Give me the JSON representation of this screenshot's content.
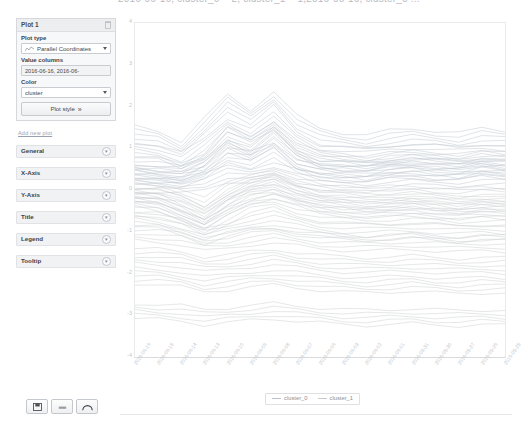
{
  "top_strip": {
    "clipped_text": "2016-06-16, cluster_0 = 2, cluster_1 = 1,2016-06-16, cluster_0 ..."
  },
  "panel": {
    "plot_card": {
      "title": "Plot 1",
      "delete_icon": "trash-icon",
      "plot_type": {
        "label": "Plot type",
        "value": "Parallel Coordinates",
        "icon": "line-chart-icon",
        "caret": "chevron-down-icon"
      },
      "value_columns": {
        "label": "Value columns",
        "value": "2016-06-16, 2016-06-"
      },
      "color": {
        "label": "Color",
        "value": "cluster",
        "caret": "chevron-down-icon"
      },
      "style_button": {
        "label": "Plot style",
        "icon": "double-chevron-right-icon"
      }
    },
    "add_link": "Add new plot",
    "accordion": [
      {
        "label": "General",
        "toggle": "collapse-toggle"
      },
      {
        "label": "X-Axis",
        "toggle": "collapse-toggle"
      },
      {
        "label": "Y-Axis",
        "toggle": "collapse-toggle"
      },
      {
        "label": "Title",
        "toggle": "collapse-toggle"
      },
      {
        "label": "Legend",
        "toggle": "collapse-toggle"
      },
      {
        "label": "Tooltip",
        "toggle": "collapse-toggle"
      }
    ],
    "toolbar": [
      {
        "name": "save-button",
        "icon": "floppy-disk-icon"
      },
      {
        "name": "export-button",
        "icon": "file-icon"
      },
      {
        "name": "theme-button",
        "icon": "arc-icon"
      }
    ]
  },
  "chart_data": {
    "type": "line",
    "title": "",
    "xlabel": "",
    "ylabel": "",
    "ylim": [
      -4,
      4
    ],
    "yticks": [
      4,
      3,
      2,
      1,
      0,
      -1,
      -2,
      -3,
      -4
    ],
    "grid": false,
    "legend_position": "bottom",
    "legend": [
      "cluster_0",
      "cluster_1"
    ],
    "colors": {
      "cluster_0": "#b9c2cc",
      "cluster_1": "#c8c9cc"
    },
    "categories": [
      "2016-06-16",
      "2016-06-15",
      "2016-06-14",
      "2016-06-13",
      "2016-06-10",
      "2016-06-09",
      "2016-06-08",
      "2016-06-07",
      "2016-06-06",
      "2016-06-03",
      "2016-06-02",
      "2016-06-01",
      "2016-05-31",
      "2016-05-30",
      "2016-05-27",
      "2016-05-26",
      "2016-05-25"
    ],
    "series": [
      {
        "name": "cluster_0",
        "values": [
          0.45,
          0.4,
          0.35,
          0.55,
          1.05,
          0.85,
          1.25,
          0.7,
          0.55,
          0.5,
          0.45,
          0.55,
          0.6,
          0.55,
          0.5,
          0.6,
          0.55
        ]
      },
      {
        "name": "cluster_0",
        "values": [
          0.3,
          0.28,
          0.25,
          0.4,
          0.8,
          0.7,
          0.95,
          0.55,
          0.4,
          0.38,
          0.35,
          0.42,
          0.45,
          0.42,
          0.4,
          0.48,
          0.45
        ]
      },
      {
        "name": "cluster_0",
        "values": [
          0.1,
          0.08,
          0.05,
          0.15,
          0.35,
          0.3,
          0.45,
          0.25,
          0.15,
          0.12,
          0.1,
          0.15,
          0.18,
          0.15,
          0.14,
          0.2,
          0.18
        ]
      },
      {
        "name": "cluster_1",
        "values": [
          -0.1,
          -0.15,
          -0.35,
          -0.6,
          -0.2,
          0.05,
          0.15,
          -0.05,
          -0.2,
          -0.25,
          -0.3,
          -0.28,
          -0.25,
          -0.3,
          -0.35,
          -0.3,
          -0.32
        ]
      },
      {
        "name": "cluster_1",
        "values": [
          -0.25,
          -0.32,
          -0.55,
          -0.8,
          -0.45,
          -0.15,
          -0.05,
          -0.25,
          -0.4,
          -0.45,
          -0.5,
          -0.48,
          -0.45,
          -0.5,
          -0.55,
          -0.5,
          -0.52
        ]
      },
      {
        "name": "cluster_1",
        "values": [
          -0.45,
          -0.5,
          -0.7,
          -0.95,
          -0.65,
          -0.4,
          -0.3,
          -0.48,
          -0.6,
          -0.65,
          -0.68,
          -0.66,
          -0.64,
          -0.68,
          -0.72,
          -0.68,
          -0.7
        ]
      },
      {
        "name": "cluster_1",
        "values": [
          -0.7,
          -0.75,
          -0.9,
          -1.1,
          -0.95,
          -0.8,
          -0.72,
          -0.85,
          -0.95,
          -1.0,
          -1.02,
          -1.0,
          -0.98,
          -1.02,
          -1.05,
          -1.02,
          -1.04
        ]
      },
      {
        "name": "cluster_1",
        "values": [
          -1.05,
          -1.08,
          -1.15,
          -1.3,
          -1.25,
          -1.15,
          -1.1,
          -1.18,
          -1.25,
          -1.28,
          -1.3,
          -1.28,
          -1.26,
          -1.3,
          -1.32,
          -1.3,
          -1.31
        ]
      },
      {
        "name": "cluster_0",
        "values": [
          1.3,
          1.2,
          0.95,
          1.5,
          2.05,
          1.7,
          2.15,
          1.55,
          1.25,
          1.15,
          1.1,
          1.2,
          1.25,
          1.2,
          1.15,
          1.25,
          1.2
        ]
      },
      {
        "name": "cluster_0",
        "values": [
          0.95,
          0.9,
          0.7,
          1.05,
          1.55,
          1.3,
          1.65,
          1.15,
          0.9,
          0.85,
          0.8,
          0.88,
          0.92,
          0.88,
          0.85,
          0.92,
          0.88
        ]
      },
      {
        "name": "cluster_1",
        "values": [
          -1.6,
          -1.62,
          -1.68,
          -1.8,
          -1.75,
          -1.68,
          -1.62,
          -1.7,
          -1.76,
          -1.8,
          -1.82,
          -1.8,
          -1.78,
          -1.82,
          -1.84,
          -1.82,
          -1.83
        ]
      },
      {
        "name": "cluster_1",
        "values": [
          -2.1,
          -2.12,
          -2.18,
          -2.3,
          -2.25,
          -2.18,
          -2.14,
          -2.2,
          -2.26,
          -2.3,
          -2.32,
          -2.3,
          -2.28,
          -2.32,
          -2.34,
          -2.32,
          -2.33
        ]
      },
      {
        "name": "cluster_1",
        "values": [
          -2.9,
          -2.92,
          -2.95,
          -3.05,
          -3.0,
          -2.94,
          -2.9,
          -2.96,
          -3.0,
          -3.04,
          -3.06,
          -3.04,
          -3.02,
          -3.05,
          -3.07,
          -3.05,
          -3.06
        ]
      },
      {
        "name": "cluster_0",
        "values": [
          0.6,
          0.55,
          0.45,
          0.7,
          1.3,
          1.05,
          1.45,
          0.95,
          0.7,
          0.65,
          0.6,
          0.68,
          0.72,
          0.68,
          0.65,
          0.72,
          0.68
        ]
      },
      {
        "name": "cluster_1",
        "values": [
          -0.02,
          -0.05,
          -0.18,
          -0.42,
          -0.05,
          0.18,
          0.3,
          0.08,
          -0.08,
          -0.12,
          -0.16,
          -0.14,
          -0.12,
          -0.16,
          -0.2,
          -0.16,
          -0.18
        ]
      }
    ]
  }
}
